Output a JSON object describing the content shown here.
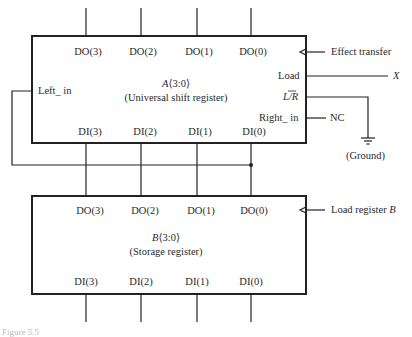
{
  "register_a": {
    "name": "A",
    "range": "⟨3:0⟩",
    "description": "(Universal shift register)",
    "outputs": [
      "DO(3)",
      "DO(2)",
      "DO(1)",
      "DO(0)"
    ],
    "inputs": [
      "DI(3)",
      "DI(2)",
      "DI(1)",
      "DI(0)"
    ],
    "left_in": "Left_ in",
    "load": "Load",
    "lr": "L/R",
    "lr_l": "L",
    "lr_r": "R",
    "right_in": "Right_ in"
  },
  "register_b": {
    "name": "B",
    "range": "⟨3:0⟩",
    "description": "(Storage register)",
    "outputs": [
      "DO(3)",
      "DO(2)",
      "DO(1)",
      "DO(0)"
    ],
    "inputs": [
      "DI(3)",
      "DI(2)",
      "DI(1)",
      "DI(0)"
    ]
  },
  "signals": {
    "effect_transfer": "Effect transfer",
    "x": "X",
    "nc": "NC",
    "ground": "(Ground)",
    "load_register_b": "Load register",
    "load_register_b_var": "B"
  },
  "caption": "Figure 5.5"
}
